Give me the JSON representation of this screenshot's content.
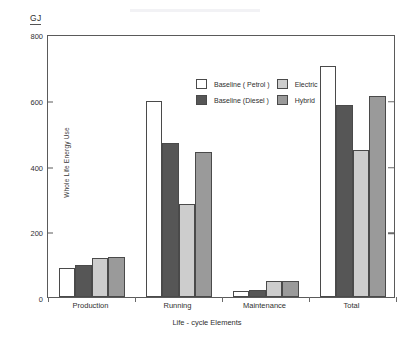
{
  "unit_label": "GJ",
  "legend": {
    "entries": [
      {
        "label": "Baseline ( Petrol )",
        "color": "#ffffff",
        "key": "petrol"
      },
      {
        "label": "Electric",
        "color": "#cdcdcd",
        "key": "electric"
      },
      {
        "label": "Baseline (Diesel )",
        "color": "#565656",
        "key": "diesel"
      },
      {
        "label": "Hybrid",
        "color": "#9a9a9a",
        "key": "hybrid"
      }
    ]
  },
  "chart_data": {
    "type": "bar",
    "title": "",
    "xlabel": "Life - cycle Elements",
    "ylabel": "Whole Life Energy Use",
    "unit": "GJ",
    "categories": [
      "Production",
      "Running",
      "Maintenance",
      "Total"
    ],
    "ylim": [
      0,
      800
    ],
    "yticks": [
      0,
      200,
      400,
      600,
      800
    ],
    "ytick_labels": [
      "0",
      "200",
      "400",
      "600",
      "800"
    ],
    "grid": false,
    "legend_position": "top-center",
    "series": [
      {
        "name": "Baseline ( Petrol )",
        "color": "#ffffff",
        "values": [
          88,
          595,
          18,
          703
        ]
      },
      {
        "name": "Baseline (Diesel )",
        "color": "#565656",
        "values": [
          97,
          470,
          20,
          585
        ]
      },
      {
        "name": "Electric",
        "color": "#cdcdcd",
        "values": [
          118,
          283,
          50,
          448
        ]
      },
      {
        "name": "Hybrid",
        "color": "#9a9a9a",
        "values": [
          122,
          440,
          50,
          610
        ]
      }
    ]
  }
}
